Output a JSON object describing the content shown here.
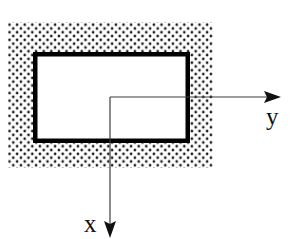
{
  "figure": {
    "type": "cross-section-diagram",
    "canvas": {
      "width": 290,
      "height": 239,
      "background": "#ffffff"
    },
    "stipple_region": {
      "name": "stippled-surrounding-medium",
      "x": 8,
      "y": 22,
      "width": 205,
      "height": 146,
      "dot_color": "#1a1a1a",
      "dot_radius": 1.35,
      "dot_spacing": 7.6,
      "fill": "#ffffff"
    },
    "rectangle": {
      "name": "rectangular-section-outline",
      "x": 33,
      "y": 52,
      "width": 157,
      "height": 91,
      "stroke_color": "#000000",
      "stroke_width": 4.5,
      "fill": "#ffffff"
    },
    "axes": {
      "origin": {
        "x": 110,
        "y": 97
      },
      "stroke_color": "#3c3c3c",
      "stroke_width": 1.2,
      "y_axis": {
        "label": "y",
        "direction": "right",
        "from": {
          "x": 110,
          "y": 97
        },
        "to": {
          "x": 281,
          "y": 97
        },
        "arrow": "right"
      },
      "x_axis": {
        "label": "x",
        "direction": "down",
        "from": {
          "x": 110,
          "y": 97
        },
        "to": {
          "x": 110,
          "y": 238
        },
        "arrow": "down"
      }
    }
  },
  "labels": {
    "y_axis_label": "y",
    "x_axis_label": "x"
  }
}
